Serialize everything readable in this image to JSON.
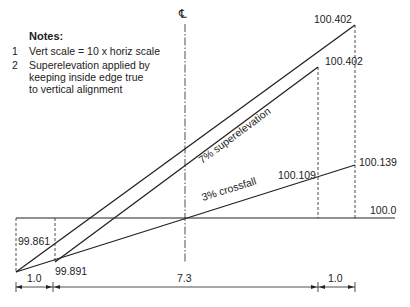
{
  "notes": {
    "title": "Notes:",
    "items": [
      {
        "num": "1",
        "text": "Vert scale = 10 x horiz scale"
      },
      {
        "num": "2",
        "text": "Superelevation applied by keeping inside edge true to vertical alignment"
      }
    ],
    "item2_lines": [
      "Superelevation applied by",
      "keeping inside edge true",
      "to vertical alignment"
    ]
  },
  "centreline_symbol": "℄",
  "labels": {
    "outer_top_level": "100.402",
    "inner_top_level": "100.402",
    "crossfall_inner_level": "100.109",
    "crossfall_outer_level": "100.139",
    "datum_level": "100.0",
    "left_outer_level": "99.861",
    "left_inner_level": "99.891",
    "superelevation": "7% superelevation",
    "crossfall": "3% crossfall"
  },
  "dimensions": {
    "left_verge": "1.0",
    "carriageway": "7.3",
    "right_verge": "1.0"
  },
  "colors": {
    "line": "#222222",
    "background": "#ffffff"
  }
}
